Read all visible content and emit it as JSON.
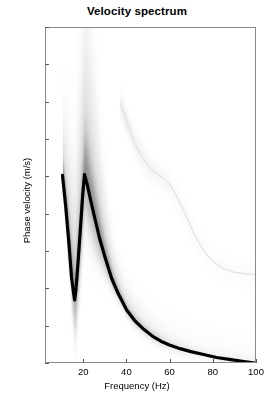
{
  "chart_data": {
    "type": "line",
    "title": "Velocity spectrum",
    "xlabel": "Frequency (Hz)",
    "ylabel": "Phase velocity (m/s)",
    "xlim": [
      2.3,
      100
    ],
    "ylim": [
      200,
      1100
    ],
    "xticks": [
      20,
      40,
      60,
      80,
      100
    ],
    "yticks": [
      200,
      300,
      400,
      500,
      600,
      700,
      800,
      900,
      1000,
      1100
    ],
    "grid": false,
    "legend": null,
    "background": "faint grayscale velocity-spectrum energy image",
    "series": [
      {
        "name": "picked dispersion curve",
        "color": "#000000",
        "linewidth": 3.2,
        "x": [
          10.0,
          11.5,
          13.0,
          14.2,
          15.2,
          15.7,
          16.3,
          17.3,
          18.4,
          19.4,
          20.3,
          21.5,
          23.0,
          25.0,
          27.5,
          30.0,
          33.0,
          36.0,
          40.0,
          44.0,
          48.0,
          52.0,
          56.0,
          60.0,
          65.0,
          70.0,
          76.0,
          82.0,
          88.0,
          94.0,
          100.0
        ],
        "y": [
          703,
          620,
          520,
          430,
          385,
          367,
          395,
          470,
          560,
          645,
          705,
          680,
          640,
          590,
          530,
          480,
          425,
          385,
          340,
          310,
          288,
          270,
          256,
          246,
          236,
          228,
          220,
          212,
          207,
          202,
          197
        ]
      },
      {
        "name": "secondary mode (faint)",
        "color": "#e2e2e2",
        "linewidth": 1.2,
        "x": [
          37.0,
          39.0,
          41.0,
          43.0,
          45.0,
          47.0,
          50.0,
          53.0,
          56.0,
          60.0,
          64.0,
          68.0,
          72.0,
          76.0,
          80.0,
          85.0,
          90.0,
          95.0,
          100.0
        ],
        "y": [
          895,
          865,
          830,
          800,
          775,
          755,
          730,
          712,
          700,
          680,
          640,
          590,
          540,
          500,
          472,
          452,
          442,
          438,
          436
        ]
      }
    ],
    "background_energy": [
      {
        "name": "streak-a",
        "freq": 12.0,
        "v_top": 1100,
        "v_bottom": 700,
        "intensity": 0.1
      },
      {
        "name": "streak-b",
        "freq": 19.5,
        "v_top": 1020,
        "v_bottom": 700,
        "intensity": 0.14
      }
    ]
  }
}
